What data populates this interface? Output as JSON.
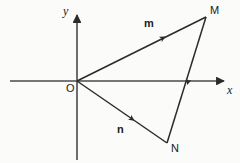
{
  "figure": {
    "type": "vector-diagram",
    "background_color": "#fbfbfa",
    "stroke_color": "#2b2b2b",
    "axes": {
      "x_axis": {
        "label": "x",
        "start": [
          10,
          81
        ],
        "end": [
          228,
          81
        ],
        "arrow": "right"
      },
      "y_axis": {
        "label": "y",
        "start": [
          77,
          160
        ],
        "end": [
          77,
          11
        ],
        "arrow": "up"
      },
      "origin": {
        "label": "O",
        "position": [
          77,
          81
        ]
      }
    },
    "points": [
      {
        "label": "M",
        "position": [
          206,
          17
        ],
        "label_position": [
          210,
          6
        ]
      },
      {
        "label": "N",
        "position": [
          167,
          143
        ],
        "label_position": [
          171,
          143
        ]
      }
    ],
    "vectors": [
      {
        "label": "m",
        "from": "O",
        "to": "M",
        "start": [
          77,
          81
        ],
        "end": [
          206,
          17
        ],
        "arrow_at": [
          162,
          37
        ],
        "label_position": [
          144,
          18
        ]
      },
      {
        "label": "n",
        "from": "O",
        "to": "N",
        "start": [
          77,
          81
        ],
        "end": [
          167,
          143
        ],
        "arrow_at": [
          131,
          119
        ],
        "label_position": [
          117,
          124
        ]
      }
    ],
    "segments": [
      {
        "name": "MN",
        "from": "M",
        "to": "N",
        "start": [
          206,
          17
        ],
        "end": [
          167,
          143
        ],
        "arrow_at": [
          186,
          81
        ],
        "crosses_x_axis_at": [
          186,
          81
        ]
      }
    ]
  }
}
